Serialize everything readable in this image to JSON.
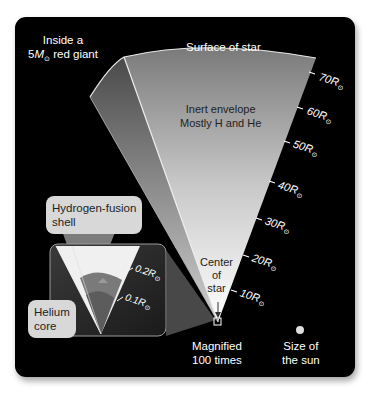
{
  "title": {
    "line1": "Inside a",
    "line2_prefix": "5",
    "line2_symbol": "M",
    "line2_sub": "⊙",
    "line2_suffix": " red giant"
  },
  "labels": {
    "surface": "Surface of star",
    "envelope_line1": "Inert envelope",
    "envelope_line2": "Mostly H and He",
    "center_line1": "Center",
    "center_line2": "of",
    "center_line3": "star",
    "magnified_line1": "Magnified",
    "magnified_line2": "100 times",
    "sun_line1": "Size of",
    "sun_line2": "the sun"
  },
  "callouts": {
    "hydrogen_line1": "Hydrogen-fusion",
    "hydrogen_line2": "shell",
    "helium_line1": "Helium",
    "helium_line2": "core"
  },
  "scale_ticks": [
    {
      "value": "70",
      "unit": "R",
      "sub": "⊙"
    },
    {
      "value": "60",
      "unit": "R",
      "sub": "⊙"
    },
    {
      "value": "50",
      "unit": "R",
      "sub": "⊙"
    },
    {
      "value": "40",
      "unit": "R",
      "sub": "⊙"
    },
    {
      "value": "30",
      "unit": "R",
      "sub": "⊙"
    },
    {
      "value": "20",
      "unit": "R",
      "sub": "⊙"
    },
    {
      "value": "10",
      "unit": "R",
      "sub": "⊙"
    }
  ],
  "inset_ticks": [
    {
      "value": "0.2",
      "unit": "R",
      "sub": "⊙"
    },
    {
      "value": "0.1",
      "unit": "R",
      "sub": "⊙"
    }
  ],
  "colors": {
    "panel": "#000000",
    "wedge_light": "#f4f4f4",
    "wedge_dark": "#6a6a6a",
    "callout_bg": "#d8d8d8",
    "inset_bg": "#2a2a2a"
  }
}
